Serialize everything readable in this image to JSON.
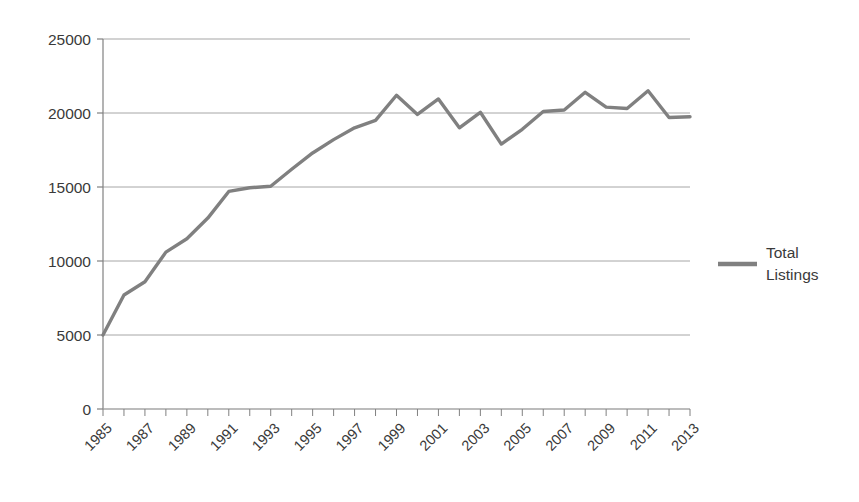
{
  "chart_data": {
    "type": "line",
    "title": "",
    "subtitle": "",
    "xlabel": "",
    "ylabel": "",
    "grid": true,
    "grid_axis": "y",
    "legend_position": "right",
    "xlim": [
      1985,
      2013
    ],
    "ylim": [
      0,
      25000
    ],
    "ytick_labels": [
      "25000",
      "20000",
      "15000",
      "10000",
      "5000",
      "0"
    ],
    "ytick_values": [
      25000,
      20000,
      15000,
      10000,
      5000,
      0
    ],
    "xtick_labels": [
      "1985",
      "1987",
      "1989",
      "1991",
      "1993",
      "1995",
      "1997",
      "1999",
      "2001",
      "2003",
      "2005",
      "2007",
      "2009",
      "2011",
      "2013"
    ],
    "xtick_values": [
      1985,
      1987,
      1989,
      1991,
      1993,
      1995,
      1997,
      1999,
      2001,
      2003,
      2005,
      2007,
      2009,
      2011,
      2013
    ],
    "x": [
      1985,
      1986,
      1987,
      1988,
      1989,
      1990,
      1991,
      1992,
      1993,
      1994,
      1995,
      1996,
      1997,
      1998,
      1999,
      2000,
      2001,
      2002,
      2003,
      2004,
      2005,
      2006,
      2007,
      2008,
      2009,
      2010,
      2011,
      2012,
      2013
    ],
    "series": [
      {
        "name": "Total Listings",
        "color": "#808080",
        "values": [
          5000,
          7700,
          8600,
          10600,
          11500,
          12900,
          14700,
          14950,
          15050,
          16200,
          17300,
          18200,
          19000,
          19500,
          21200,
          19900,
          20950,
          19000,
          20050,
          17900,
          18900,
          20100,
          20200,
          21400,
          20400,
          20300,
          21500,
          19700,
          19750
        ]
      }
    ],
    "legend": [
      {
        "label_line1": "Total",
        "label_line2": "Listings",
        "color": "#808080"
      }
    ],
    "colors": {
      "series": "#808080",
      "grid": "#a6a6a6",
      "axis": "#808080",
      "text": "#3a3a3a",
      "background": "#ffffff"
    }
  }
}
